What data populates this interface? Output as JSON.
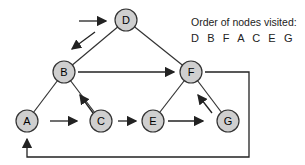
{
  "legend": {
    "title": "Order of nodes visited:",
    "order": "D B F A C E G"
  },
  "nodes": [
    {
      "id": "D",
      "x": 126,
      "y": 20
    },
    {
      "id": "B",
      "x": 64,
      "y": 72
    },
    {
      "id": "F",
      "x": 191,
      "y": 72
    },
    {
      "id": "A",
      "x": 27,
      "y": 121
    },
    {
      "id": "C",
      "x": 101,
      "y": 121
    },
    {
      "id": "E",
      "x": 153,
      "y": 121
    },
    {
      "id": "G",
      "x": 228,
      "y": 121
    }
  ],
  "edges": [
    [
      "D",
      "B"
    ],
    [
      "D",
      "F"
    ],
    [
      "B",
      "A"
    ],
    [
      "B",
      "C"
    ],
    [
      "F",
      "E"
    ],
    [
      "F",
      "G"
    ]
  ],
  "colors": {
    "node_fill": "#cfcfcf",
    "stroke": "#333333",
    "text": "#222222"
  }
}
